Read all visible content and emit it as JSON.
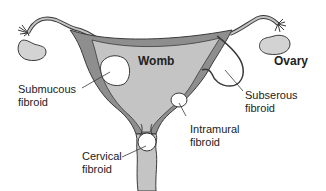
{
  "diagram": {
    "type": "anatomical",
    "colors": {
      "outer_wall": "#8e8e8e",
      "inner_cavity": "#c4c4c4",
      "ovary_fill": "#d3d3d3",
      "outline": "#3a3a3a",
      "fibroid_fill": "#ffffff",
      "text": "#222222"
    },
    "labels": {
      "womb": "Womb",
      "ovary": "Ovary",
      "submucous_line1": "Submucous",
      "submucous_line2": "fibroid",
      "subserous_line1": "Subserous",
      "subserous_line2": "fibroid",
      "intramural_line1": "Intramural",
      "intramural_line2": "fibroid",
      "cervical_line1": "Cervical",
      "cervical_line2": "fibroid"
    }
  }
}
